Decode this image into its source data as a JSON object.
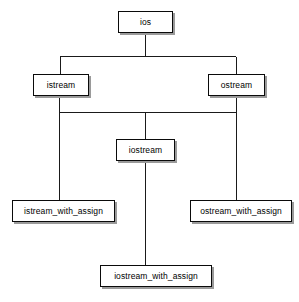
{
  "diagram": {
    "type": "inheritance-tree",
    "background_color": "#ffffff",
    "line_color": "#1a1a1a",
    "box_fill_color": "#ffffff",
    "box_border_color": "#0a0a0a",
    "shadow_color": "#9a9a9a",
    "nodes": [
      {
        "id": "ios",
        "label": "ios",
        "x": 118,
        "y": 11,
        "width": 55,
        "height": 22,
        "level": 0
      },
      {
        "id": "istream",
        "label": "istream",
        "x": 33,
        "y": 74,
        "width": 56,
        "height": 22,
        "level": 1
      },
      {
        "id": "ostream",
        "label": "ostream",
        "x": 208,
        "y": 74,
        "width": 57,
        "height": 22,
        "level": 1
      },
      {
        "id": "iostream",
        "label": "iostream",
        "x": 116,
        "y": 139,
        "width": 59,
        "height": 22,
        "level": 2
      },
      {
        "id": "istream_with_assign",
        "label": "istream_with_assign",
        "x": 12,
        "y": 200,
        "width": 103,
        "height": 22,
        "level": 3
      },
      {
        "id": "ostream_with_assign",
        "label": "ostream_with_assign",
        "x": 190,
        "y": 200,
        "width": 102,
        "height": 22,
        "level": 3
      },
      {
        "id": "iostream_with_assign",
        "label": "iostream_with_assign",
        "x": 100,
        "y": 265,
        "width": 112,
        "height": 22,
        "level": 4
      }
    ],
    "edges": [
      {
        "from": "ios",
        "to": "istream",
        "style": "orthogonal"
      },
      {
        "from": "ios",
        "to": "ostream",
        "style": "orthogonal"
      },
      {
        "from": "istream",
        "to": "iostream",
        "style": "orthogonal"
      },
      {
        "from": "ostream",
        "to": "iostream",
        "style": "orthogonal"
      },
      {
        "from": "istream",
        "to": "istream_with_assign",
        "style": "orthogonal"
      },
      {
        "from": "ostream",
        "to": "ostream_with_assign",
        "style": "orthogonal"
      },
      {
        "from": "iostream",
        "to": "iostream_with_assign",
        "style": "orthogonal"
      }
    ]
  }
}
